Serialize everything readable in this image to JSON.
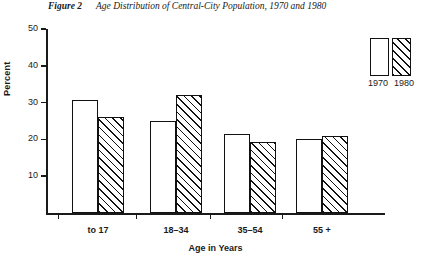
{
  "caption": {
    "figure_number": "Figure 2",
    "title": "Age Distribution of Central-City Population, 1970 and 1980"
  },
  "legend": {
    "position": "top-right",
    "entries": [
      {
        "label": "1970",
        "swatch": "open-box"
      },
      {
        "label": "1980",
        "swatch": "hatched-box"
      }
    ]
  },
  "chart_data": {
    "type": "bar",
    "title": "Age Distribution of Central-City Population, 1970 and 1980",
    "xlabel": "Age in Years",
    "ylabel": "Percent",
    "categories": [
      "to 17",
      "18–34",
      "35–54",
      "55 +"
    ],
    "series": [
      {
        "name": "1970",
        "values": [
          30.7,
          25.0,
          21.5,
          20.0
        ]
      },
      {
        "name": "1980",
        "values": [
          26.0,
          32.0,
          19.3,
          21.0
        ]
      }
    ],
    "ylim": [
      0,
      50
    ],
    "yticks": [
      10,
      20,
      30,
      40,
      50
    ],
    "ytick_labels": [
      "10",
      "20",
      "30",
      "40",
      "50"
    ],
    "grid": false,
    "legend_position": "top-right"
  },
  "colors": {
    "ink": "#111111",
    "background": "#ffffff"
  }
}
